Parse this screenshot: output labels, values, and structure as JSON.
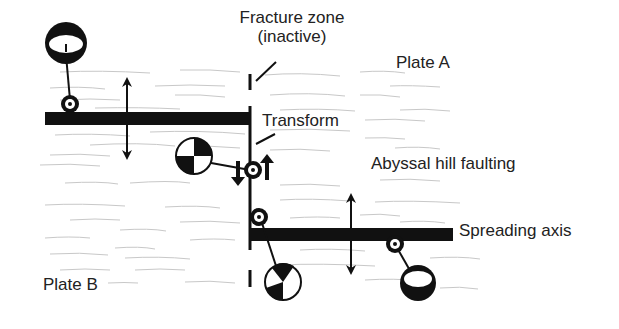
{
  "diagram": {
    "type": "mid-ocean ridge transform fault schematic",
    "labels": {
      "fracture_zone_line1": "Fracture zone",
      "fracture_zone_line2": "(inactive)",
      "plate_a": "Plate A",
      "transform": "Transform",
      "abyssal_hill": "Abyssal hill faulting",
      "spreading_axis": "Spreading axis",
      "plate_b": "Plate B"
    },
    "elements": [
      {
        "id": "upper-spreading-segment",
        "kind": "thick black bar"
      },
      {
        "id": "lower-spreading-segment",
        "kind": "thick black bar"
      },
      {
        "id": "transform-fault",
        "kind": "vertical line"
      },
      {
        "id": "fracture-zone",
        "kind": "dashed vertical line"
      },
      {
        "id": "focal-mechanism-normal-upper",
        "kind": "beachball (normal faulting)"
      },
      {
        "id": "focal-mechanism-strike-slip",
        "kind": "beachball (strike-slip)"
      },
      {
        "id": "focal-mechanism-lower-ridge",
        "kind": "beachball"
      },
      {
        "id": "focal-mechanism-normal-lower",
        "kind": "beachball (normal faulting)"
      },
      {
        "id": "spreading-arrow-left",
        "kind": "double-headed arrow"
      },
      {
        "id": "spreading-arrow-right",
        "kind": "double-headed arrow"
      }
    ],
    "colors": {
      "ink": "#111111",
      "texture": "#c8c8c8",
      "background": "#ffffff"
    }
  }
}
